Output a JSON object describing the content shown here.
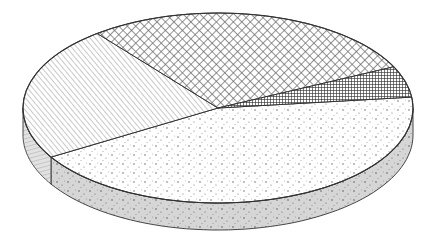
{
  "chart_data": {
    "type": "pie",
    "variant": "3d-exploded-none",
    "title": "",
    "categories": [
      "Stippled (dots)",
      "Crosshatch (diamond)",
      "Diagonal lines",
      "Dense grid"
    ],
    "values": [
      43.2,
      28.5,
      23.0,
      5.3
    ],
    "unit": "percent (estimated from slice angles)",
    "labels_visible": false,
    "legend": "none",
    "slices": [
      {
        "name": "Stippled (dots)",
        "pattern": "dots",
        "start_deg": -6.6,
        "end_deg": 148.9,
        "share": 43.2
      },
      {
        "name": "Diagonal lines",
        "pattern": "diagonal-lines",
        "start_deg": 148.9,
        "end_deg": 231.7,
        "share": 23.0
      },
      {
        "name": "Crosshatch (diamond)",
        "pattern": "crosshatch",
        "start_deg": 231.7,
        "end_deg": 334.3,
        "share": 28.5
      },
      {
        "name": "Dense grid",
        "pattern": "grid",
        "start_deg": 334.3,
        "end_deg": 353.4,
        "share": 5.3
      }
    ],
    "geometry": {
      "cx": 218,
      "cy": 108,
      "rx": 195,
      "ry": 95,
      "depth": 27
    },
    "colors": {
      "stroke": "#333333",
      "side_fill": "#d4d4d4",
      "top_fill": "#ffffff",
      "pattern_ink": "#555555"
    }
  }
}
